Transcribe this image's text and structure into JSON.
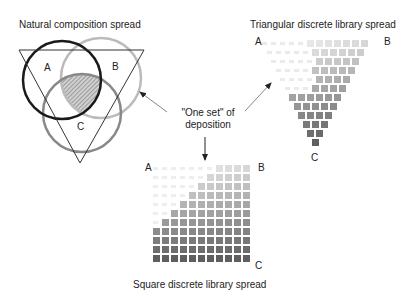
{
  "titles": {
    "natural": "Natural composition spread",
    "triangular": "Triangular discrete library spread",
    "square": "Square discrete library spread"
  },
  "annotation": {
    "line1": "\"One set\" of",
    "line2": "deposition"
  },
  "venn": {
    "labels": {
      "a": "A",
      "b": "B",
      "c": "C"
    },
    "circles": [
      {
        "name": "A",
        "cx": 62,
        "cy": 80,
        "r": 39,
        "stroke": "#1a1a1a",
        "width": 2.5
      },
      {
        "name": "B",
        "cx": 101,
        "cy": 78,
        "r": 40,
        "stroke": "#bbbbbb",
        "width": 2.5
      },
      {
        "name": "C",
        "cx": 82,
        "cy": 113,
        "r": 39,
        "stroke": "#888888",
        "width": 2.5
      }
    ],
    "triangle": {
      "stroke": "#333333"
    },
    "intersection_fill": "#999999"
  },
  "triangular_library": {
    "labels": {
      "a": "A",
      "b": "B",
      "c": "C"
    },
    "rows": 12,
    "pitch": 9,
    "origin_x": 262,
    "origin_y": 40
  },
  "square_library": {
    "labels": {
      "a": "A",
      "b": "B",
      "c": "C"
    },
    "rows": 11,
    "cols": 11,
    "pitch": 9,
    "origin_x": 153,
    "origin_y": 165
  },
  "colors": {
    "arrow": "#888888",
    "arrow_head": "#222222"
  }
}
